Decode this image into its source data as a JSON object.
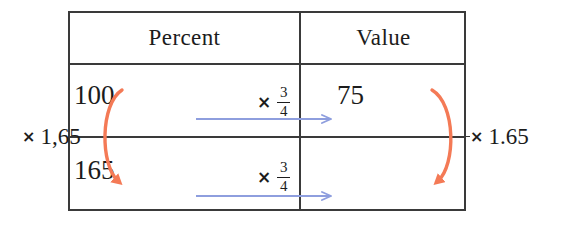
{
  "diagram": {
    "title_visible": false,
    "type": "proportion-table",
    "table": {
      "columns": [
        {
          "id": "percent",
          "header": "Percent"
        },
        {
          "id": "value",
          "header": "Value"
        }
      ],
      "rows": [
        {
          "percent": "100",
          "value": "75"
        },
        {
          "percent": "165",
          "value": ""
        }
      ]
    },
    "horizontal_operators": [
      {
        "row": 1,
        "times_symbol": "×",
        "numerator": "3",
        "denominator": "4"
      },
      {
        "row": 2,
        "times_symbol": "×",
        "numerator": "3",
        "denominator": "4"
      }
    ],
    "side_operators": [
      {
        "position": "left",
        "times_symbol": "×",
        "factor": "1,65"
      },
      {
        "position": "right",
        "times_symbol": "×",
        "factor": "1.65"
      }
    ],
    "colors": {
      "rule": "#3a3a3a",
      "text": "#1c1c1c",
      "horizontal_arrow": "#8e9ede",
      "vertical_arrow": "#f47a56"
    }
  },
  "icons": {
    "right_arrow": "arrow-right-icon",
    "curved_arrow_left": "curved-arrow-down-left-icon",
    "curved_arrow_right": "curved-arrow-down-right-icon"
  }
}
